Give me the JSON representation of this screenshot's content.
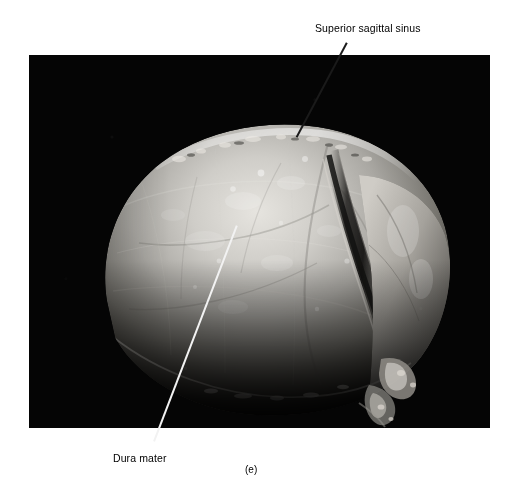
{
  "figure": {
    "caption": "(e)",
    "caption_x": 245,
    "caption_y": 464,
    "media_type": "anatomical-photograph",
    "plate": {
      "x": 29,
      "y": 55,
      "width": 461,
      "height": 373,
      "background_color": "#050505"
    }
  },
  "labels": [
    {
      "id": "superior-sagittal-sinus",
      "text": "Superior sagittal sinus",
      "text_x": 315,
      "text_y": 22,
      "leader": {
        "x1": 347,
        "y1": 42,
        "x2": 297,
        "y2": 136,
        "color": "#1a1a1a",
        "style": "dark"
      }
    },
    {
      "id": "dura-mater",
      "text": "Dura mater",
      "text_x": 113,
      "text_y": 452,
      "leader": {
        "x1": 237,
        "y1": 225,
        "x2": 154,
        "y2": 441,
        "color": "#f2f2f2",
        "style": "light"
      }
    }
  ],
  "colors": {
    "page_background": "#ffffff",
    "photo_background": "#050505",
    "dura_highlight": "#e8e6e2",
    "dura_midtone": "#9c9a96",
    "dura_shadow": "#3c3b39",
    "text": "#000000"
  }
}
